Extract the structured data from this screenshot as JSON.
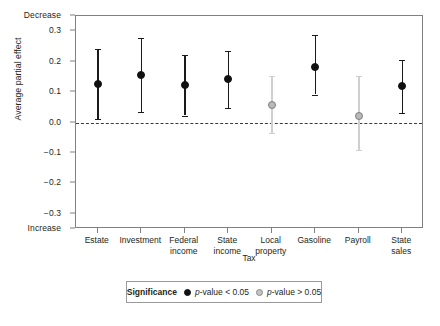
{
  "chart_data": {
    "type": "scatter",
    "title": "",
    "xlabel": "Tax",
    "ylabel": "Average partial effect",
    "ylim": [
      -0.35,
      0.35
    ],
    "yticks": [
      "0.3",
      "0.2",
      "0.1",
      "0.0",
      "-0.1",
      "-0.2",
      "-0.3"
    ],
    "ytick_values": [
      0.3,
      0.2,
      0.1,
      0.0,
      -0.1,
      -0.2,
      -0.3
    ],
    "y_axis_top_annotation": "Decrease",
    "y_axis_bottom_annotation": "Increase",
    "grid": false,
    "zero_reference_line": 0.0,
    "categories": [
      "Estate",
      "Investment",
      "Federal income",
      "State income",
      "Local property",
      "Gasoline",
      "Payroll",
      "State sales"
    ],
    "category_lines": [
      [
        "Estate"
      ],
      [
        "Investment"
      ],
      [
        "Federal",
        "income"
      ],
      [
        "State",
        "income"
      ],
      [
        "Local",
        "property"
      ],
      [
        "Gasoline"
      ],
      [
        "Payroll"
      ],
      [
        "State",
        "sales"
      ]
    ],
    "values": [
      0.125,
      0.155,
      0.123,
      0.142,
      0.058,
      0.184,
      0.021,
      0.12
    ],
    "ci_low": [
      0.01,
      0.034,
      0.023,
      0.047,
      -0.033,
      0.092,
      -0.091,
      0.032
    ],
    "ci_high": [
      0.241,
      0.277,
      0.222,
      0.234,
      0.152,
      0.288,
      0.152,
      0.205
    ],
    "significance": [
      "p-value < 0.05",
      "p-value < 0.05",
      "p-value < 0.05",
      "p-value < 0.05",
      "p-value > 0.05",
      "p-value < 0.05",
      "p-value > 0.05",
      "p-value < 0.05"
    ],
    "legend": {
      "position": "bottom",
      "title": "Significance",
      "entries": [
        {
          "label_prefix": "p",
          "label_rest": "-value < 0.05",
          "marker": "filled-black-circle",
          "color": "#111111"
        },
        {
          "label_prefix": "p",
          "label_rest": "-value > 0.05",
          "marker": "open-gray-circle",
          "color": "#c4c4c4"
        }
      ]
    },
    "colors": {
      "significant": "#111111",
      "not_significant": "#c4c4c4",
      "axis": "#808080",
      "zero_line": "#3a3a3a",
      "text": "#231f20"
    }
  }
}
